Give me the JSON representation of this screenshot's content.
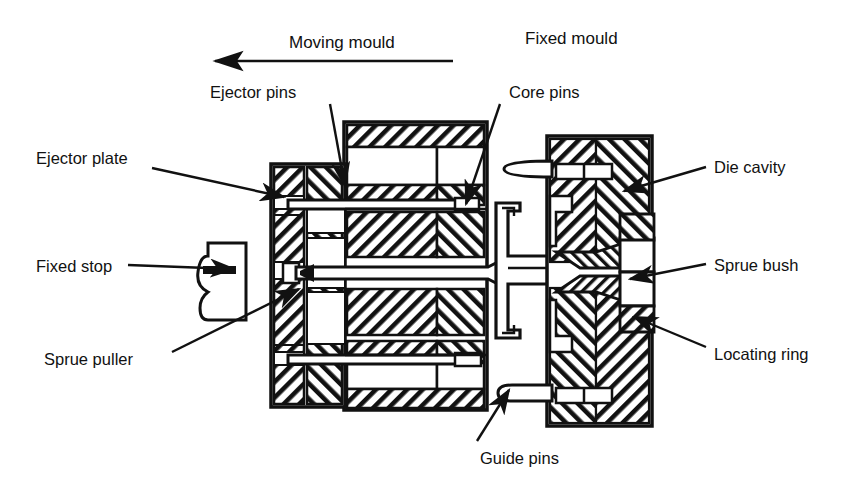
{
  "figure": {
    "type": "technical-cross-section-diagram",
    "background_color": "#ffffff",
    "line_color": "#111111"
  },
  "headings": {
    "moving_mould": "Moving mould",
    "fixed_mould": "Fixed mould"
  },
  "direction_arrow": {
    "name": "moving-mould-direction-arrow",
    "points": "left",
    "description": "Horizontal arrow under 'Moving mould' pointing left"
  },
  "labels": [
    {
      "id": "ejector-pins",
      "text": "Ejector pins",
      "x": 210,
      "y": 92,
      "align": "left"
    },
    {
      "id": "ejector-plate",
      "text": "Ejector plate",
      "x": 36,
      "y": 158,
      "align": "left"
    },
    {
      "id": "fixed-stop",
      "text": "Fixed stop",
      "x": 36,
      "y": 256,
      "align": "left"
    },
    {
      "id": "sprue-puller",
      "text": "Sprue puller",
      "x": 44,
      "y": 358,
      "align": "left"
    },
    {
      "id": "core-pins",
      "text": "Core pins",
      "x": 507,
      "y": 92,
      "align": "left"
    },
    {
      "id": "die-cavity",
      "text": "Die cavity",
      "x": 712,
      "y": 160,
      "align": "left"
    },
    {
      "id": "sprue-bush",
      "text": "Sprue bush",
      "x": 712,
      "y": 258,
      "align": "left"
    },
    {
      "id": "locating-ring",
      "text": "Locating ring",
      "x": 712,
      "y": 352,
      "align": "left"
    },
    {
      "id": "guide-pins",
      "text": "Guide pins",
      "x": 476,
      "y": 452,
      "align": "left"
    }
  ],
  "leader_lines": [
    {
      "id": "leader-ejector-pins",
      "from": [
        330,
        104
      ],
      "to": [
        345,
        190
      ]
    },
    {
      "id": "leader-ejector-plate",
      "from": [
        150,
        168
      ],
      "to": [
        287,
        196
      ]
    },
    {
      "id": "leader-fixed-stop",
      "from": [
        125,
        265
      ],
      "to": [
        238,
        268
      ]
    },
    {
      "id": "leader-sprue-puller",
      "from": [
        170,
        352
      ],
      "to": [
        300,
        290
      ]
    },
    {
      "id": "leader-core-pins",
      "from": [
        500,
        104
      ],
      "to": [
        464,
        208
      ]
    },
    {
      "id": "leader-die-cavity",
      "from": [
        705,
        168
      ],
      "to": [
        620,
        192
      ]
    },
    {
      "id": "leader-sprue-bush",
      "from": [
        705,
        265
      ],
      "to": [
        628,
        280
      ]
    },
    {
      "id": "leader-locating-ring",
      "from": [
        705,
        348
      ],
      "to": [
        632,
        318
      ]
    },
    {
      "id": "leader-guide-pins",
      "from": [
        476,
        444
      ],
      "to": [
        508,
        392
      ]
    }
  ],
  "parts": {
    "moving_half": {
      "name": "moving-mould-half",
      "ejector_plate_assembly": "Two hatched ejector plates at the left of the moving half",
      "backing_plates": "Stacked hatched blocks forming the moving mould body",
      "ejector_pins_count": 2,
      "sprue_puller_pin": "Central long pin with barbed tip pointing right"
    },
    "fixed_half": {
      "name": "fixed-mould-half",
      "cavity_plate": "Chevron-hatched cavity plate",
      "sprue_bush": "Conical bush on the moulding axis",
      "locating_ring": "Ring at the rear face of the fixed half",
      "guide_pins_count": 2
    },
    "moulding": {
      "name": "moulded-part-with-sprue",
      "description": "Ejected moulding outline with sprue between the mould halves"
    }
  }
}
